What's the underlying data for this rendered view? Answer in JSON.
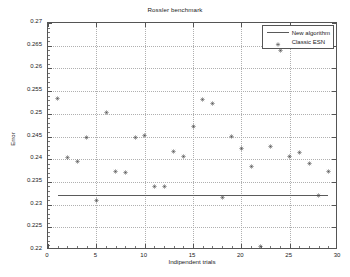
{
  "chart_data": {
    "type": "scatter",
    "title": "Rossler benchmark",
    "xlabel": "Indipendent trials",
    "ylabel": "Error",
    "xlim": [
      0,
      30
    ],
    "ylim": [
      0.22,
      0.27
    ],
    "xticks": [
      0,
      5,
      10,
      15,
      20,
      25,
      30
    ],
    "xtick_labels": [
      "0",
      "5",
      "10",
      "15",
      "20",
      "25",
      "30"
    ],
    "yticks": [
      0.22,
      0.225,
      0.23,
      0.235,
      0.24,
      0.245,
      0.25,
      0.255,
      0.26,
      0.265,
      0.27
    ],
    "ytick_labels": [
      "0.22",
      "0.225",
      "0.23",
      "0.235",
      "0.24",
      "0.245",
      "0.25",
      "0.255",
      "0.26",
      "0.265",
      "0.27"
    ],
    "grid": true,
    "legend_position": "top-right",
    "series": [
      {
        "name": "New algorithm",
        "type": "line",
        "marker": "none",
        "color": "#5a5a5a",
        "x": [
          1,
          29
        ],
        "values": [
          0.2321,
          0.2321
        ]
      },
      {
        "name": "Classic ESN",
        "type": "scatter",
        "marker": "star",
        "color": "#4a4a4a",
        "x": [
          1,
          2,
          3,
          4,
          5,
          6,
          7,
          8,
          9,
          10,
          11,
          12,
          13,
          14,
          15,
          16,
          17,
          18,
          19,
          20,
          21,
          22,
          23,
          24,
          25,
          26,
          27,
          28,
          29,
          30
        ],
        "values": [
          0.2534,
          0.2404,
          0.2394,
          0.2447,
          0.2309,
          0.2502,
          0.2372,
          0.2371,
          0.2447,
          0.2452,
          0.2339,
          0.2339,
          0.2418,
          0.2406,
          0.2472,
          0.2531,
          0.2523,
          0.2316,
          0.2451,
          0.2423,
          0.2383,
          0.2208,
          0.2427,
          0.264,
          0.2407,
          0.2414,
          0.239,
          0.232,
          0.2374,
          0.2467
        ]
      }
    ]
  },
  "legend": {
    "entries": [
      {
        "label": "New algorithm",
        "marker": "line"
      },
      {
        "label": "Classic ESN",
        "marker": "star"
      }
    ]
  }
}
